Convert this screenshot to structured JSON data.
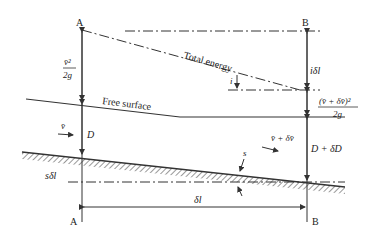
{
  "diagram": {
    "section_labels": {
      "top_left": "A",
      "top_right": "B",
      "bottom_left": "A",
      "bottom_right": "B"
    },
    "labels": {
      "total_energy": "Total energy",
      "free_surface": "Free surface",
      "velocity_head_a_num": "v̄²",
      "velocity_head_a_den": "2g",
      "velocity_head_b_num": "(v̄ + δv̄)²",
      "velocity_head_b_den": "2g",
      "energy_slope": "i",
      "head_loss": "iδl",
      "depth_a": "D",
      "depth_b": "D + δD",
      "velocity_a": "v̄",
      "velocity_b": "v̄ + δv̄",
      "bed_slope": "s",
      "bed_drop": "sδl",
      "length": "δl"
    }
  }
}
